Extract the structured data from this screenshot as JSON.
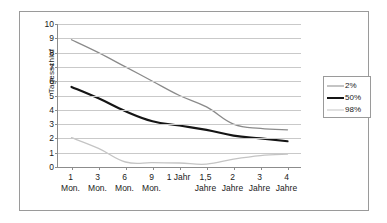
{
  "chart_data": {
    "type": "line",
    "title": "",
    "subtitle": "",
    "xlabel": "",
    "ylabel": "Tagesschlaf",
    "ylim": [
      0,
      10
    ],
    "y_ticks": [
      0,
      1,
      2,
      3,
      4,
      5,
      6,
      7,
      8,
      9,
      10
    ],
    "y_tick_labels": [
      "0",
      "1",
      "2",
      "3",
      "4",
      "5",
      "6",
      "7",
      "8",
      "9",
      "10"
    ],
    "grid": true,
    "grid_axis": "y",
    "legend_position": "right",
    "categories": [
      "1 Mon.",
      "3 Mon.",
      "6 Mon.",
      "9 Mon.",
      "1 Jahr",
      "1,5 Jahre",
      "2 Jahre",
      "3 Jahre",
      "4 Jahre"
    ],
    "x_tick_labels": [
      {
        "line1": "1",
        "line2": "Mon."
      },
      {
        "line1": "3",
        "line2": "Mon."
      },
      {
        "line1": "6",
        "line2": "Mon."
      },
      {
        "line1": "9",
        "line2": "Mon."
      },
      {
        "line1": "1 Jahr",
        "line2": ""
      },
      {
        "line1": "1,5",
        "line2": "Jahre"
      },
      {
        "line1": "2",
        "line2": "Jahre"
      },
      {
        "line1": "3",
        "line2": "Jahre"
      },
      {
        "line1": "4",
        "line2": "Jahre"
      }
    ],
    "series": [
      {
        "name": "2%",
        "color": "#8a8a8a",
        "width": 1.3,
        "values": [
          8.9,
          8.0,
          7.0,
          6.0,
          5.0,
          4.2,
          3.0,
          2.7,
          2.6
        ]
      },
      {
        "name": "50%",
        "color": "#151515",
        "width": 2.2,
        "values": [
          5.6,
          4.8,
          3.9,
          3.2,
          2.9,
          2.6,
          2.2,
          2.0,
          1.8
        ]
      },
      {
        "name": "98%",
        "color": "#c4c4c4",
        "width": 1.3,
        "values": [
          2.05,
          1.3,
          0.35,
          0.3,
          0.28,
          0.2,
          0.55,
          0.8,
          0.9
        ]
      }
    ]
  },
  "legend": {
    "entries": [
      {
        "label": "2%"
      },
      {
        "label": "50%"
      },
      {
        "label": "98%"
      }
    ]
  }
}
